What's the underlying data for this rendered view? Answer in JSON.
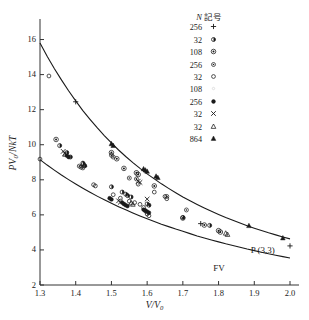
{
  "chart_data": {
    "type": "scatter",
    "title": "",
    "xlabel": "V/V0",
    "xlabel_display": "V/V₀",
    "ylabel": "PV0/NkT",
    "ylabel_display": "PV₀/NkT",
    "xlim": [
      1.3,
      2.0
    ],
    "ylim": [
      2,
      17
    ],
    "grid": false,
    "xticks": [
      1.3,
      1.4,
      1.5,
      1.6,
      1.7,
      1.8,
      1.9,
      2.0
    ],
    "xtick_labels": [
      "1.3",
      "1.4",
      "1.5",
      "1.6",
      "1.7",
      "1.8",
      "1.9",
      "2.0"
    ],
    "yticks": [
      2,
      4,
      6,
      8,
      10,
      12,
      14,
      16
    ],
    "ytick_labels": [
      "2",
      "4",
      "6",
      "8",
      "10",
      "12",
      "14",
      "16"
    ],
    "legend_position": "top-right",
    "curves": [
      {
        "name": "P(3,3)",
        "label": "P (3,3)",
        "label_x": 1.89,
        "label_y": 3.95,
        "points": [
          [
            1.3,
            15.8
          ],
          [
            1.32,
            15.05
          ],
          [
            1.34,
            14.35
          ],
          [
            1.36,
            13.7
          ],
          [
            1.38,
            13.08
          ],
          [
            1.4,
            12.5
          ],
          [
            1.42,
            11.95
          ],
          [
            1.44,
            11.45
          ],
          [
            1.46,
            10.97
          ],
          [
            1.48,
            10.52
          ],
          [
            1.5,
            10.1
          ],
          [
            1.52,
            9.7
          ],
          [
            1.54,
            9.33
          ],
          [
            1.56,
            8.98
          ],
          [
            1.58,
            8.65
          ],
          [
            1.6,
            8.34
          ],
          [
            1.62,
            8.05
          ],
          [
            1.64,
            7.77
          ],
          [
            1.66,
            7.51
          ],
          [
            1.68,
            7.26
          ],
          [
            1.7,
            7.02
          ],
          [
            1.72,
            6.8
          ],
          [
            1.74,
            6.59
          ],
          [
            1.76,
            6.39
          ],
          [
            1.78,
            6.2
          ],
          [
            1.8,
            6.02
          ],
          [
            1.82,
            5.85
          ],
          [
            1.84,
            5.69
          ],
          [
            1.86,
            5.53
          ],
          [
            1.88,
            5.38
          ],
          [
            1.9,
            5.24
          ],
          [
            1.92,
            5.11
          ],
          [
            1.94,
            4.98
          ],
          [
            1.96,
            4.86
          ],
          [
            1.98,
            4.74
          ],
          [
            2.0,
            4.63
          ]
        ]
      },
      {
        "name": "FV",
        "label": "FV",
        "label_x": 1.785,
        "label_y": 2.92,
        "points": [
          [
            1.3,
            9.15
          ],
          [
            1.32,
            8.84
          ],
          [
            1.34,
            8.55
          ],
          [
            1.36,
            8.27
          ],
          [
            1.38,
            8.01
          ],
          [
            1.4,
            7.76
          ],
          [
            1.42,
            7.52
          ],
          [
            1.44,
            7.29
          ],
          [
            1.46,
            7.07
          ],
          [
            1.48,
            6.86
          ],
          [
            1.5,
            6.66
          ],
          [
            1.52,
            6.47
          ],
          [
            1.54,
            6.29
          ],
          [
            1.56,
            6.11
          ],
          [
            1.58,
            5.94
          ],
          [
            1.6,
            5.78
          ],
          [
            1.62,
            5.62
          ],
          [
            1.64,
            5.47
          ],
          [
            1.66,
            5.33
          ],
          [
            1.68,
            5.19
          ],
          [
            1.7,
            5.06
          ],
          [
            1.72,
            4.93
          ],
          [
            1.74,
            4.8
          ],
          [
            1.76,
            4.68
          ],
          [
            1.78,
            4.57
          ],
          [
            1.8,
            4.46
          ],
          [
            1.82,
            4.35
          ],
          [
            1.84,
            4.25
          ],
          [
            1.86,
            4.15
          ],
          [
            1.88,
            4.05
          ],
          [
            1.9,
            3.96
          ],
          [
            1.92,
            3.87
          ],
          [
            1.94,
            3.78
          ],
          [
            1.96,
            3.7
          ],
          [
            1.98,
            3.62
          ],
          [
            2.0,
            3.54
          ]
        ]
      }
    ],
    "series": [
      {
        "name": "N=256 plus",
        "n": "256",
        "symbol": "plus",
        "values": [
          [
            1.4,
            12.45
          ],
          [
            1.75,
            5.5
          ],
          [
            2.0,
            4.23
          ]
        ]
      },
      {
        "name": "N=32 half-filled-circle",
        "n": "32",
        "symbol": "half-filled-circle",
        "values": [
          [
            1.355,
            9.95
          ],
          [
            1.375,
            9.55
          ],
          [
            1.385,
            9.3
          ],
          [
            1.42,
            8.95
          ],
          [
            1.425,
            8.8
          ],
          [
            1.5,
            7.6
          ],
          [
            1.53,
            7.3
          ],
          [
            1.54,
            7.18
          ],
          [
            1.545,
            7.1
          ],
          [
            1.555,
            7.02
          ],
          [
            1.6,
            6.62
          ],
          [
            1.605,
            6.55
          ],
          [
            1.7,
            5.85
          ],
          [
            1.775,
            5.4
          ]
        ]
      },
      {
        "name": "N=108 double-circle",
        "n": "108",
        "symbol": "double-circle",
        "values": [
          [
            1.345,
            10.3
          ],
          [
            1.5,
            9.55
          ],
          [
            1.515,
            9.2
          ],
          [
            1.535,
            8.65
          ],
          [
            1.57,
            8.4
          ],
          [
            1.575,
            8.3
          ],
          [
            1.62,
            7.65
          ],
          [
            1.7,
            5.82
          ],
          [
            1.76,
            5.42
          ],
          [
            1.8,
            5.1
          ],
          [
            1.805,
            5.02
          ]
        ]
      },
      {
        "name": "N=256 small-double-circle",
        "n": "256",
        "symbol": "small-double-circle",
        "values": [
          [
            1.41,
            8.78
          ],
          [
            1.415,
            8.72
          ],
          [
            1.42,
            8.68
          ],
          [
            1.5,
            9.4
          ],
          [
            1.505,
            9.3
          ],
          [
            1.55,
            8.1
          ],
          [
            1.57,
            8.05
          ],
          [
            1.655,
            7.05
          ],
          [
            1.71,
            6.28
          ]
        ]
      },
      {
        "name": "N=32 open-circle",
        "n": "32",
        "symbol": "open-circle",
        "values": [
          [
            1.3,
            9.18
          ],
          [
            1.325,
            13.92
          ],
          [
            1.45,
            7.72
          ],
          [
            1.455,
            7.65
          ],
          [
            1.505,
            7.15
          ],
          [
            1.525,
            6.95
          ],
          [
            1.55,
            6.78
          ],
          [
            1.565,
            6.7
          ],
          [
            1.575,
            7.75
          ],
          [
            1.58,
            6.6
          ],
          [
            1.59,
            6.42
          ],
          [
            1.595,
            6.22
          ],
          [
            1.6,
            6.05
          ],
          [
            1.605,
            5.95
          ],
          [
            1.62,
            7.3
          ],
          [
            1.65,
            7.05
          ],
          [
            1.655,
            6.92
          ]
        ]
      },
      {
        "name": "N=108 faint",
        "n": "108",
        "symbol": "faint-dot",
        "values": []
      },
      {
        "name": "N=256 filled-circle",
        "n": "256",
        "symbol": "filled-circle",
        "values": [
          [
            1.375,
            9.38
          ],
          [
            1.38,
            9.3
          ],
          [
            1.495,
            6.95
          ],
          [
            1.5,
            6.88
          ],
          [
            1.53,
            6.7
          ],
          [
            1.535,
            6.62
          ],
          [
            1.54,
            6.55
          ],
          [
            1.545,
            6.5
          ],
          [
            1.59,
            6.3
          ],
          [
            1.595,
            6.25
          ],
          [
            1.6,
            6.18
          ],
          [
            1.605,
            6.12
          ]
        ]
      },
      {
        "name": "N=32 cross",
        "n": "32",
        "symbol": "cross",
        "values": [
          [
            1.365,
            9.62
          ],
          [
            1.37,
            9.5
          ],
          [
            1.52,
            6.8
          ],
          [
            1.525,
            6.72
          ],
          [
            1.575,
            7.92
          ],
          [
            1.58,
            7.85
          ],
          [
            1.6,
            6.9
          ]
        ]
      },
      {
        "name": "N=32 open-triangle",
        "n": "32",
        "symbol": "open-triangle",
        "values": [
          [
            1.37,
            9.45
          ],
          [
            1.42,
            8.92
          ],
          [
            1.425,
            8.85
          ],
          [
            1.555,
            6.68
          ],
          [
            1.56,
            6.6
          ],
          [
            1.82,
            4.95
          ],
          [
            1.825,
            4.88
          ]
        ]
      },
      {
        "name": "N=864 filled-triangle",
        "n": "864",
        "symbol": "filled-triangle",
        "values": [
          [
            1.5,
            10.05
          ],
          [
            1.505,
            9.95
          ],
          [
            1.59,
            8.62
          ],
          [
            1.595,
            8.55
          ],
          [
            1.6,
            8.48
          ],
          [
            1.625,
            8.2
          ],
          [
            1.63,
            8.12
          ],
          [
            1.885,
            5.38
          ],
          [
            1.98,
            4.68
          ]
        ]
      }
    ]
  },
  "legend": {
    "header_n": "N",
    "header_symbol": "記号",
    "rows": [
      {
        "n": "256",
        "symbol": "plus"
      },
      {
        "n": "32",
        "symbol": "half-filled-circle"
      },
      {
        "n": "108",
        "symbol": "double-circle"
      },
      {
        "n": "256",
        "symbol": "small-double-circle"
      },
      {
        "n": "32",
        "symbol": "open-circle"
      },
      {
        "n": "108",
        "symbol": "faint-dot"
      },
      {
        "n": "256",
        "symbol": "filled-circle"
      },
      {
        "n": "32",
        "symbol": "cross"
      },
      {
        "n": "32",
        "symbol": "open-triangle"
      },
      {
        "n": "864",
        "symbol": "filled-triangle"
      }
    ]
  },
  "colors": {
    "ink": "#1a1a1a",
    "axis": "#333333",
    "background": "#ffffff"
  }
}
